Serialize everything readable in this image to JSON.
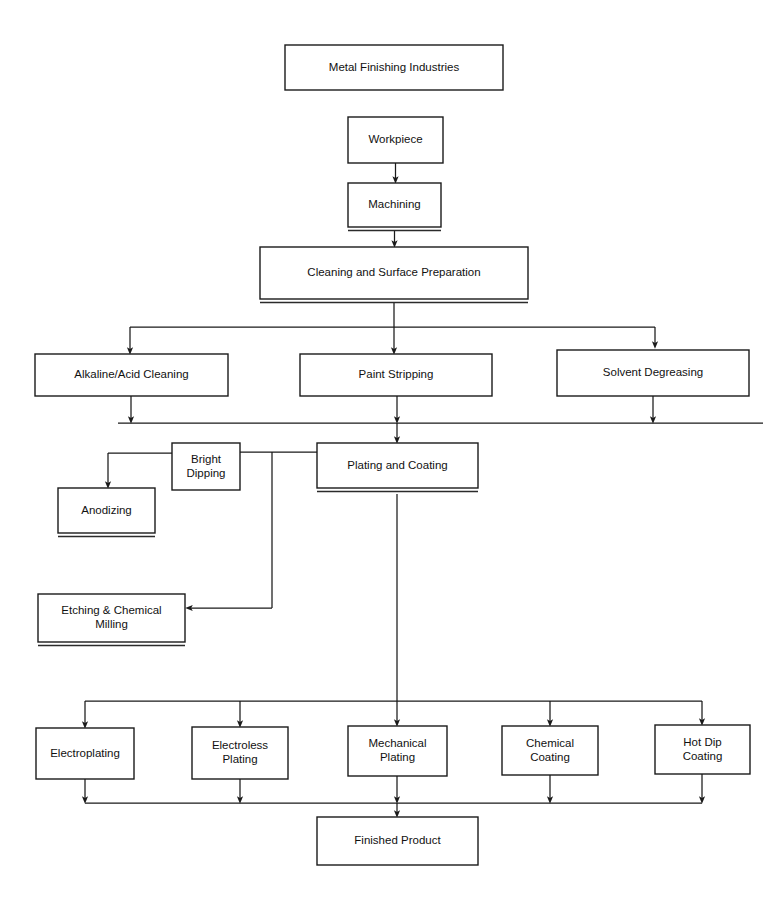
{
  "diagram": {
    "type": "flowchart",
    "background_color": "#ffffff",
    "line_color": "#1a1a1a",
    "text_color": "#111111",
    "nodes": [
      {
        "id": "metal-finishing-industries",
        "label": "Metal Finishing Industries",
        "lines": [
          "Metal Finishing Industries"
        ],
        "x": 285,
        "y": 45,
        "w": 218,
        "h": 45,
        "shadow": false
      },
      {
        "id": "workpiece",
        "label": "Workpiece",
        "lines": [
          "Workpiece"
        ],
        "x": 348,
        "y": 117,
        "w": 95,
        "h": 46,
        "shadow": false
      },
      {
        "id": "machining",
        "label": "Machining",
        "lines": [
          "Machining"
        ],
        "x": 348,
        "y": 183,
        "w": 93,
        "h": 44,
        "shadow": true
      },
      {
        "id": "cleaning-and-surface-preparation",
        "label": "Cleaning and Surface Preparation",
        "lines": [
          "Cleaning and Surface Preparation"
        ],
        "x": 260,
        "y": 247,
        "w": 268,
        "h": 52,
        "shadow": true
      },
      {
        "id": "alkaline-acid-cleaning",
        "label": "Alkaline/Acid Cleaning",
        "lines": [
          "Alkaline/Acid Cleaning"
        ],
        "x": 35,
        "y": 354,
        "w": 193,
        "h": 42,
        "shadow": false
      },
      {
        "id": "paint-stripping",
        "label": "Paint Stripping",
        "lines": [
          "Paint Stripping"
        ],
        "x": 300,
        "y": 354,
        "w": 192,
        "h": 42,
        "shadow": false
      },
      {
        "id": "solvent-degreasing",
        "label": "Solvent Degreasing",
        "lines": [
          "Solvent Degreasing"
        ],
        "x": 557,
        "y": 350,
        "w": 192,
        "h": 46,
        "shadow": false
      },
      {
        "id": "bright-dipping",
        "label": "Bright Dipping",
        "lines": [
          "Bright",
          "Dipping"
        ],
        "x": 172,
        "y": 443,
        "w": 68,
        "h": 47,
        "shadow": false
      },
      {
        "id": "plating-and-coating",
        "label": "Plating and Coating",
        "lines": [
          "Plating and Coating"
        ],
        "x": 317,
        "y": 443,
        "w": 161,
        "h": 45,
        "shadow": true
      },
      {
        "id": "anodizing",
        "label": "Anodizing",
        "lines": [
          "Anodizing"
        ],
        "x": 58,
        "y": 488,
        "w": 97,
        "h": 45,
        "shadow": true
      },
      {
        "id": "etching-and-chemical-milling",
        "label": "Etching & Chemical Milling",
        "lines": [
          "Etching & Chemical",
          "Milling"
        ],
        "x": 38,
        "y": 594,
        "w": 147,
        "h": 48,
        "shadow": true
      },
      {
        "id": "electroplating",
        "label": "Electroplating",
        "lines": [
          "Electroplating"
        ],
        "x": 36,
        "y": 728,
        "w": 98,
        "h": 51,
        "shadow": false
      },
      {
        "id": "electroless-plating",
        "label": "Electroless Plating",
        "lines": [
          "Electroless",
          "Plating"
        ],
        "x": 192,
        "y": 727,
        "w": 96,
        "h": 52,
        "shadow": false
      },
      {
        "id": "mechanical-plating",
        "label": "Mechanical Plating",
        "lines": [
          "Mechanical",
          "Plating"
        ],
        "x": 348,
        "y": 726,
        "w": 99,
        "h": 50,
        "shadow": false
      },
      {
        "id": "chemical-coating",
        "label": "Chemical Coating",
        "lines": [
          "Chemical",
          "Coating"
        ],
        "x": 502,
        "y": 726,
        "w": 96,
        "h": 49,
        "shadow": false
      },
      {
        "id": "hot-dip-coating",
        "label": "Hot Dip Coating",
        "lines": [
          "Hot Dip",
          "Coating"
        ],
        "x": 655,
        "y": 725,
        "w": 95,
        "h": 49,
        "shadow": false
      },
      {
        "id": "finished-product",
        "label": "Finished Product",
        "lines": [
          "Finished Product"
        ],
        "x": 317,
        "y": 817,
        "w": 161,
        "h": 48,
        "shadow": false
      }
    ],
    "edges": [
      {
        "id": "workpiece-to-machining",
        "from": "workpiece",
        "to": "machining"
      },
      {
        "id": "machining-to-cleaning",
        "from": "machining",
        "to": "cleaning-and-surface-preparation"
      },
      {
        "id": "cleaning-to-alkaline-acid-cleaning",
        "from": "cleaning-and-surface-preparation",
        "to": "alkaline-acid-cleaning"
      },
      {
        "id": "cleaning-to-paint-stripping",
        "from": "cleaning-and-surface-preparation",
        "to": "paint-stripping"
      },
      {
        "id": "cleaning-to-solvent-degreasing",
        "from": "cleaning-and-surface-preparation",
        "to": "solvent-degreasing"
      },
      {
        "id": "alkaline-acid-cleaning-to-plating",
        "from": "alkaline-acid-cleaning",
        "to": "plating-and-coating"
      },
      {
        "id": "paint-stripping-to-plating",
        "from": "paint-stripping",
        "to": "plating-and-coating"
      },
      {
        "id": "solvent-degreasing-to-plating",
        "from": "solvent-degreasing",
        "to": "plating-and-coating"
      },
      {
        "id": "plating-to-bright-dipping",
        "from": "plating-and-coating",
        "to": "bright-dipping"
      },
      {
        "id": "bright-dipping-to-anodizing",
        "from": "bright-dipping",
        "to": "anodizing"
      },
      {
        "id": "bright-dipping-to-etching",
        "from": "bright-dipping",
        "to": "etching-and-chemical-milling"
      },
      {
        "id": "plating-to-electroplating",
        "from": "plating-and-coating",
        "to": "electroplating"
      },
      {
        "id": "plating-to-electroless-plating",
        "from": "plating-and-coating",
        "to": "electroless-plating"
      },
      {
        "id": "plating-to-mechanical-plating",
        "from": "plating-and-coating",
        "to": "mechanical-plating"
      },
      {
        "id": "plating-to-chemical-coating",
        "from": "plating-and-coating",
        "to": "chemical-coating"
      },
      {
        "id": "plating-to-hot-dip-coating",
        "from": "plating-and-coating",
        "to": "hot-dip-coating"
      },
      {
        "id": "electroplating-to-finished-product",
        "from": "electroplating",
        "to": "finished-product"
      },
      {
        "id": "electroless-plating-to-finished-product",
        "from": "electroless-plating",
        "to": "finished-product"
      },
      {
        "id": "mechanical-plating-to-finished-product",
        "from": "mechanical-plating",
        "to": "finished-product"
      },
      {
        "id": "chemical-coating-to-finished-product",
        "from": "chemical-coating",
        "to": "finished-product"
      },
      {
        "id": "hot-dip-coating-to-finished-product",
        "from": "hot-dip-coating",
        "to": "finished-product"
      }
    ],
    "paths": [
      {
        "id": "path-workpiece-machining",
        "d": "M 395.5 163 L 395.5 180",
        "arrow": true
      },
      {
        "id": "path-machining-cleaning",
        "d": "M 394.5 231 L 394.5 244",
        "arrow": true
      },
      {
        "id": "path-cleaning-bus-stem",
        "d": "M 394 303 L 394 327",
        "arrow": false
      },
      {
        "id": "path-cleaning-bus",
        "d": "M 130 327 L 655 327",
        "arrow": false
      },
      {
        "id": "path-bus-to-alkaline",
        "d": "M 130 327 L 130 351",
        "arrow": true
      },
      {
        "id": "path-bus-to-paint",
        "d": "M 394 327 L 394 351",
        "arrow": true
      },
      {
        "id": "path-bus-to-solvent",
        "d": "M 655 327 L 655 345",
        "arrow": true
      },
      {
        "id": "path-alkaline-down",
        "d": "M 131 396 L 131 420",
        "arrow": true
      },
      {
        "id": "path-paint-down",
        "d": "M 397 396 L 397 420",
        "arrow": true
      },
      {
        "id": "path-solvent-down",
        "d": "M 653 396 L 653 420",
        "arrow": true
      },
      {
        "id": "path-merge-bus",
        "d": "M 118 423 L 763 423",
        "arrow": false
      },
      {
        "id": "path-merge-to-plating",
        "d": "M 397 423 L 397 440",
        "arrow": true
      },
      {
        "id": "path-plating-to-bright",
        "d": "M 317 452 L 240 452",
        "arrow": false
      },
      {
        "id": "path-bright-to-anodize-h",
        "d": "M 172 453 L 108 453",
        "arrow": false
      },
      {
        "id": "path-bright-to-anodize-v",
        "d": "M 108 453 L 108 485",
        "arrow": true
      },
      {
        "id": "path-etching-drop",
        "d": "M 272 452 L 272 608",
        "arrow": false
      },
      {
        "id": "path-etching-h",
        "d": "M 272 608 L 189 608",
        "arrow": true
      },
      {
        "id": "path-plating-stem",
        "d": "M 397 494 L 397 701",
        "arrow": false
      },
      {
        "id": "path-bottom-bus",
        "d": "M 85 701 L 702 701",
        "arrow": false
      },
      {
        "id": "path-bus-to-electroplating",
        "d": "M 85 701 L 85 725",
        "arrow": true
      },
      {
        "id": "path-bus-to-electroless",
        "d": "M 240 701 L 240 724",
        "arrow": true
      },
      {
        "id": "path-bus-to-mechanical",
        "d": "M 397 701 L 397 723",
        "arrow": true
      },
      {
        "id": "path-bus-to-chemical",
        "d": "M 550 701 L 550 723",
        "arrow": true
      },
      {
        "id": "path-bus-to-hotdip",
        "d": "M 702 701 L 702 722",
        "arrow": true
      },
      {
        "id": "path-electroplating-down",
        "d": "M 85 779 L 85 800",
        "arrow": true
      },
      {
        "id": "path-electroless-down",
        "d": "M 240 779 L 240 800",
        "arrow": true
      },
      {
        "id": "path-mechanical-down",
        "d": "M 397 776 L 397 800",
        "arrow": true
      },
      {
        "id": "path-chemical-down",
        "d": "M 550 775 L 550 800",
        "arrow": true
      },
      {
        "id": "path-hotdip-down",
        "d": "M 702 774 L 702 800",
        "arrow": true
      },
      {
        "id": "path-final-bus",
        "d": "M 85 803 L 702 803",
        "arrow": false
      },
      {
        "id": "path-final-to-product",
        "d": "M 397 803 L 397 814",
        "arrow": true
      }
    ]
  }
}
